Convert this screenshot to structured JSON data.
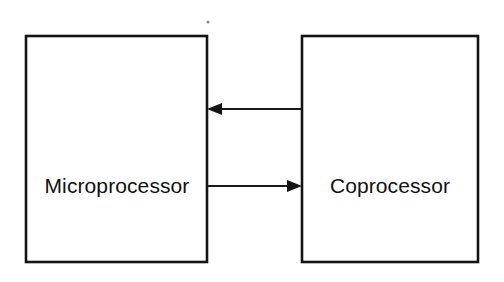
{
  "diagram": {
    "type": "block-diagram",
    "background_color": "#ffffff",
    "line_color": "#141414",
    "text_color": "#111111",
    "canvas": {
      "width": 504,
      "height": 282
    },
    "nodes": [
      {
        "id": "microprocessor",
        "label": "Microprocessor",
        "shape": "rectangle",
        "x": 26,
        "y": 36,
        "width": 181,
        "height": 226,
        "label_x": 117,
        "label_y": 186
      },
      {
        "id": "coprocessor",
        "label": "Coprocessor",
        "shape": "rectangle",
        "x": 302,
        "y": 36,
        "width": 176,
        "height": 226,
        "label_x": 390,
        "label_y": 186
      }
    ],
    "connections": [
      {
        "id": "coprocessor-to-microprocessor",
        "label": "",
        "from": "coprocessor",
        "to": "microprocessor",
        "direction": "left",
        "y": 109,
        "start_x": 302,
        "end_x": 207,
        "head_length": 15,
        "head_half_width": 6
      },
      {
        "id": "microprocessor-to-coprocessor",
        "label": "",
        "from": "microprocessor",
        "to": "coprocessor",
        "direction": "right",
        "y": 186,
        "start_x": 207,
        "end_x": 302,
        "head_length": 15,
        "head_half_width": 6
      }
    ],
    "artifacts": [
      {
        "id": "scan-speck",
        "x": 208,
        "y": 22,
        "radius": 1.6
      }
    ]
  }
}
